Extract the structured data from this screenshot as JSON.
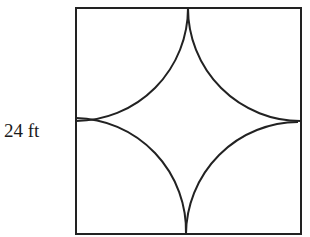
{
  "figure": {
    "side_label": "24 ft",
    "shape": "square with four quarter-circle arcs centered at the corners",
    "stroke_color": "#222222"
  }
}
